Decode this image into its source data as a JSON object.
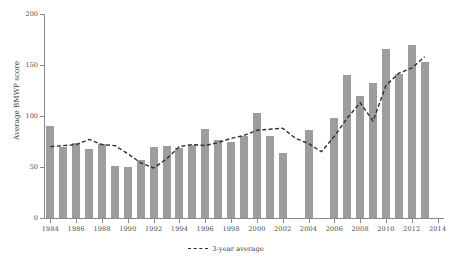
{
  "chart_data": {
    "type": "bar",
    "title": "",
    "subtitle": "",
    "xlabel": "",
    "ylabel": "Average BMWP score",
    "ylim": [
      0,
      200
    ],
    "yticks": [
      0,
      50,
      100,
      150,
      200
    ],
    "ytick_labels": [
      "0",
      "50",
      "100",
      "150",
      "200"
    ],
    "xlim": [
      1983.5,
      2014.5
    ],
    "xticks": [
      1984,
      1986,
      1988,
      1990,
      1992,
      1994,
      1996,
      1998,
      2000,
      2002,
      2004,
      2006,
      2008,
      2010,
      2012,
      2014
    ],
    "xtick_labels": [
      "1984",
      "1986",
      "1988",
      "1990",
      "1992",
      "1994",
      "1996",
      "1998",
      "2000",
      "2002",
      "2004",
      "2006",
      "2008",
      "2010",
      "2012",
      "2014"
    ],
    "grid": false,
    "legend_position": "bottom-center",
    "bar_color": "#9d9d9d",
    "line_color": "#2e2e2e",
    "categories": [
      1984,
      1985,
      1986,
      1987,
      1988,
      1989,
      1990,
      1991,
      1992,
      1993,
      1994,
      1995,
      1996,
      1997,
      1998,
      1999,
      2000,
      2001,
      2002,
      2003,
      2004,
      2005,
      2006,
      2007,
      2008,
      2009,
      2010,
      2011,
      2012,
      2013
    ],
    "series": [
      {
        "name": "Average BMWP score",
        "type": "bar",
        "values": [
          90,
          70,
          74,
          68,
          73,
          51,
          50,
          57,
          70,
          71,
          69,
          72,
          87,
          76,
          75,
          80,
          103,
          80,
          64,
          null,
          86,
          null,
          98,
          140,
          120,
          132,
          166,
          141,
          170,
          153
        ]
      },
      {
        "name": "3-year average",
        "type": "line",
        "style": "dashed",
        "values": [
          70,
          71,
          72,
          77,
          72,
          71,
          63,
          54,
          49,
          58,
          70,
          72,
          71,
          74,
          78,
          81,
          86,
          87,
          88,
          78,
          73,
          65,
          80,
          98,
          113,
          95,
          130,
          142,
          147,
          158
        ]
      }
    ],
    "legend": [
      "3-year average"
    ]
  },
  "legend": {
    "line_label": "3-year average"
  }
}
